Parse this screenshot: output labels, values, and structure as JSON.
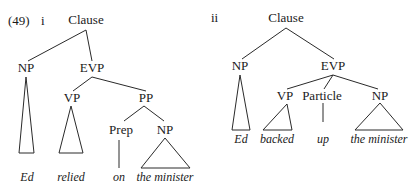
{
  "example": {
    "number": "(49)",
    "trees": [
      {
        "id": "i",
        "label": "i",
        "root": "Clause",
        "nodes": {
          "np": "NP",
          "evp": "EVP",
          "vp": "VP",
          "pp": "PP",
          "prep": "Prep",
          "pp_np": "NP"
        },
        "terminals": {
          "ed": "Ed",
          "relied": "relied",
          "on": "on",
          "the_minister": "the minister"
        }
      },
      {
        "id": "ii",
        "label": "ii",
        "root": "Clause",
        "nodes": {
          "np": "NP",
          "evp": "EVP",
          "vp": "VP",
          "particle": "Particle",
          "evp_np": "NP"
        },
        "terminals": {
          "ed": "Ed",
          "backed": "backed",
          "up": "up",
          "the_minister": "the minister"
        }
      }
    ]
  }
}
